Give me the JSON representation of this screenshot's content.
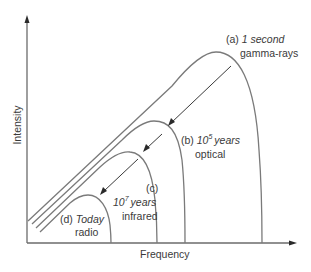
{
  "diagram": {
    "axes": {
      "x_label": "Frequency",
      "y_label": "Intensity"
    },
    "curves": [
      {
        "id": "a",
        "prefix": "(a)",
        "time": "1 second",
        "time_base": "",
        "time_exp": "",
        "band": "gamma-rays"
      },
      {
        "id": "b",
        "prefix": "(b)",
        "time": "",
        "time_base": "10",
        "time_exp": "5",
        "time_unit": "years",
        "band": "optical"
      },
      {
        "id": "c",
        "prefix": "(c)",
        "time": "",
        "time_base": "10",
        "time_exp": "7",
        "time_unit": "years",
        "band": "infrared"
      },
      {
        "id": "d",
        "prefix": "(d)",
        "time": "Today",
        "time_base": "",
        "time_exp": "",
        "band": "radio"
      }
    ],
    "arrows": [
      {
        "from": "a",
        "to": "b",
        "meaning": "cooling over time"
      },
      {
        "from": "b",
        "to": "c",
        "meaning": "cooling over time"
      },
      {
        "from": "c",
        "to": "d",
        "meaning": "cooling over time"
      }
    ]
  }
}
